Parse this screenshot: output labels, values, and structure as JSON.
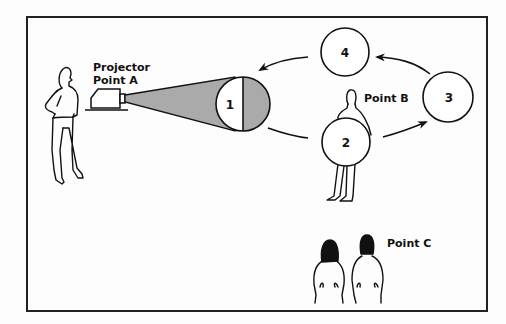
{
  "diagram": {
    "labels": {
      "projector_line1": "Projector",
      "projector_line2": "Point A",
      "point_b": "Point B",
      "point_c": "Point C"
    },
    "circles": [
      {
        "id": "1",
        "label": "1",
        "cx": 243,
        "cy": 104,
        "r": 27,
        "half_shaded": true
      },
      {
        "id": "2",
        "label": "2",
        "cx": 346,
        "cy": 142,
        "r": 24
      },
      {
        "id": "3",
        "label": "3",
        "cx": 448,
        "cy": 97,
        "r": 25
      },
      {
        "id": "4",
        "label": "4",
        "cx": 345,
        "cy": 52,
        "r": 24
      }
    ],
    "flow": [
      "1",
      "2",
      "3",
      "4",
      "1"
    ],
    "colors": {
      "stroke": "#111111",
      "beam_fill": "#aaaaaa",
      "background": "#fdfdfd"
    }
  }
}
